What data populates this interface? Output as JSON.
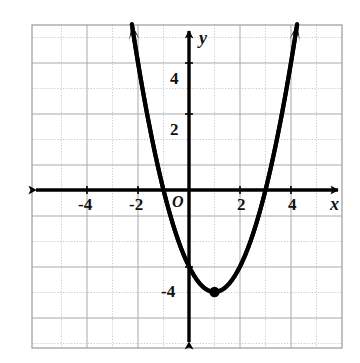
{
  "figure": {
    "background_color": "#ffffff",
    "grid_border_color": "#9a9a9a",
    "grid_major_color": "#a8a8a8",
    "grid_minor_color": "#c9c9c9",
    "axis_color": "#000000",
    "curve_color": "#000000",
    "origin_label": "O",
    "x_axis_name": "x",
    "y_axis_name": "y"
  },
  "chart_data": {
    "type": "line",
    "title": "",
    "subtitle": "",
    "xlabel": "x",
    "ylabel": "y",
    "xlim": [
      -6.1,
      6.7
    ],
    "ylim": [
      -6.45,
      6.5
    ],
    "grid": true,
    "grid_major_step": 2,
    "grid_minor_step": 1,
    "legend": "none",
    "x_tick_labels": [
      "-4",
      "-2",
      "2",
      "4"
    ],
    "x_tick_values": [
      -4,
      -2,
      2,
      4
    ],
    "y_tick_labels": [
      "4",
      "2",
      "-4"
    ],
    "y_tick_values": [
      4,
      2,
      -4
    ],
    "origin_label": "O",
    "series": [
      {
        "name": "parabola",
        "equation": "y = x^2 - 2x - 3",
        "vertex": [
          1,
          -4
        ],
        "roots": [
          -1,
          3
        ],
        "y_intercept": -3,
        "opens": "up",
        "x": [
          -1.9,
          -1.5,
          -1,
          -0.5,
          0,
          0.5,
          1,
          1.5,
          2,
          2.5,
          3,
          3.5,
          3.9
        ],
        "values": [
          4.41,
          2.25,
          0,
          -1.75,
          -3,
          -3.75,
          -4,
          -3.75,
          -3,
          -1.75,
          0,
          2.25,
          4.41
        ],
        "arrow_start": true,
        "arrow_end": true
      }
    ],
    "points": [
      {
        "label": "vertex",
        "x": 1,
        "y": -4,
        "marker": "filled-circle"
      }
    ]
  }
}
